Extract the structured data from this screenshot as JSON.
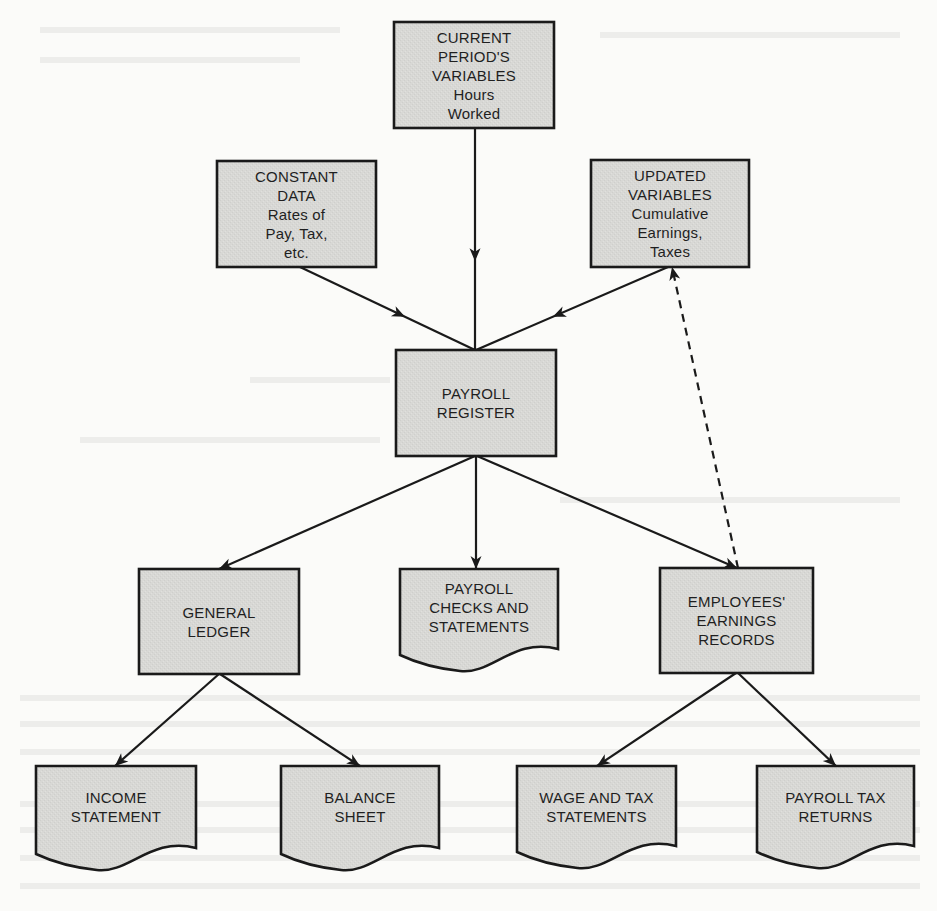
{
  "diagram": {
    "type": "flowchart",
    "title": "",
    "colors": {
      "node_fill": "#d9d9d6",
      "node_stroke": "#1a1a1a",
      "edge": "#1a1a1a",
      "background": "#fbfbf9"
    },
    "nodes": [
      {
        "id": "current_vars",
        "shape": "rectangle",
        "lines": [
          "CURRENT",
          "PERIOD'S",
          "VARIABLES",
          "Hours",
          "Worked"
        ],
        "box": {
          "x": 394,
          "y": 22,
          "w": 160,
          "h": 106
        }
      },
      {
        "id": "constant_data",
        "shape": "rectangle",
        "lines": [
          "CONSTANT",
          "DATA",
          "Rates of",
          "Pay, Tax,",
          "etc."
        ],
        "box": {
          "x": 217,
          "y": 161,
          "w": 159,
          "h": 106
        }
      },
      {
        "id": "updated_vars",
        "shape": "rectangle",
        "lines": [
          "UPDATED",
          "VARIABLES",
          "Cumulative",
          "Earnings,",
          "Taxes"
        ],
        "box": {
          "x": 591,
          "y": 160,
          "w": 158,
          "h": 107
        }
      },
      {
        "id": "payroll_register",
        "shape": "rectangle",
        "lines": [
          "PAYROLL",
          "REGISTER"
        ],
        "box": {
          "x": 396,
          "y": 350,
          "w": 160,
          "h": 106
        }
      },
      {
        "id": "general_ledger",
        "shape": "rectangle",
        "lines": [
          "GENERAL",
          "LEDGER"
        ],
        "box": {
          "x": 139,
          "y": 569,
          "w": 160,
          "h": 105
        }
      },
      {
        "id": "payroll_checks",
        "shape": "document",
        "lines": [
          "PAYROLL",
          "CHECKS AND",
          "STATEMENTS"
        ],
        "box": {
          "x": 400,
          "y": 569,
          "w": 158,
          "h": 102
        }
      },
      {
        "id": "earnings_records",
        "shape": "rectangle",
        "lines": [
          "EMPLOYEES'",
          "EARNINGS",
          "RECORDS"
        ],
        "box": {
          "x": 660,
          "y": 568,
          "w": 153,
          "h": 105
        }
      },
      {
        "id": "income_statement",
        "shape": "document",
        "lines": [
          "INCOME",
          "STATEMENT"
        ],
        "box": {
          "x": 36,
          "y": 766,
          "w": 160,
          "h": 104
        }
      },
      {
        "id": "balance_sheet",
        "shape": "document",
        "lines": [
          "BALANCE",
          "SHEET"
        ],
        "box": {
          "x": 281,
          "y": 766,
          "w": 158,
          "h": 104
        }
      },
      {
        "id": "wage_tax_statements",
        "shape": "document",
        "lines": [
          "WAGE AND TAX",
          "STATEMENTS"
        ],
        "box": {
          "x": 517,
          "y": 766,
          "w": 159,
          "h": 102
        }
      },
      {
        "id": "payroll_tax_returns",
        "shape": "document",
        "lines": [
          "PAYROLL TAX",
          "RETURNS"
        ],
        "box": {
          "x": 757,
          "y": 766,
          "w": 157,
          "h": 102
        }
      }
    ],
    "edges": [
      {
        "from": "current_vars",
        "to": "payroll_register",
        "style": "solid",
        "arrow": "mid",
        "points": [
          [
            475,
            128
          ],
          [
            475,
            350
          ]
        ]
      },
      {
        "from": "constant_data",
        "to": "payroll_register",
        "style": "solid",
        "arrow": "mid",
        "points": [
          [
            300,
            267
          ],
          [
            475,
            350
          ]
        ]
      },
      {
        "from": "updated_vars",
        "to": "payroll_register",
        "style": "solid",
        "arrow": "mid",
        "points": [
          [
            668,
            267
          ],
          [
            476,
            350
          ]
        ]
      },
      {
        "from": "payroll_register",
        "to": "general_ledger",
        "style": "solid",
        "arrow": "end",
        "points": [
          [
            475,
            456
          ],
          [
            219,
            569
          ]
        ]
      },
      {
        "from": "payroll_register",
        "to": "payroll_checks",
        "style": "solid",
        "arrow": "end",
        "points": [
          [
            476,
            456
          ],
          [
            476,
            569
          ]
        ]
      },
      {
        "from": "payroll_register",
        "to": "earnings_records",
        "style": "solid",
        "arrow": "end",
        "points": [
          [
            477,
            456
          ],
          [
            737,
            568
          ]
        ]
      },
      {
        "from": "earnings_records",
        "to": "updated_vars",
        "style": "dashed",
        "arrow": "end",
        "points": [
          [
            738,
            568
          ],
          [
            672,
            267
          ]
        ]
      },
      {
        "from": "general_ledger",
        "to": "income_statement",
        "style": "solid",
        "arrow": "end",
        "points": [
          [
            219,
            674
          ],
          [
            115,
            766
          ]
        ]
      },
      {
        "from": "general_ledger",
        "to": "balance_sheet",
        "style": "solid",
        "arrow": "end",
        "points": [
          [
            220,
            674
          ],
          [
            360,
            766
          ]
        ]
      },
      {
        "from": "earnings_records",
        "to": "wage_tax_statements",
        "style": "solid",
        "arrow": "end",
        "points": [
          [
            736,
            673
          ],
          [
            597,
            766
          ]
        ]
      },
      {
        "from": "earnings_records",
        "to": "payroll_tax_returns",
        "style": "solid",
        "arrow": "end",
        "points": [
          [
            738,
            673
          ],
          [
            836,
            766
          ]
        ]
      }
    ]
  }
}
